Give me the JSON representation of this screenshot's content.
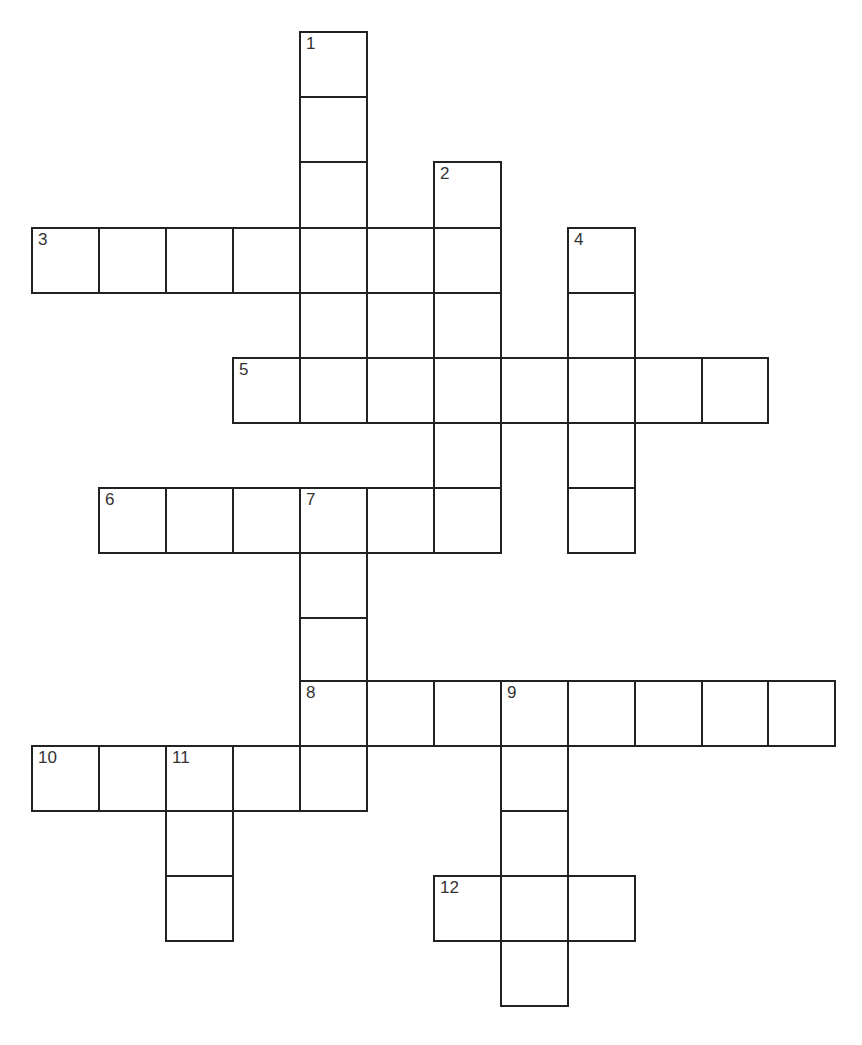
{
  "puzzle": {
    "type": "crossword",
    "line_color": "#222222",
    "number_color": "#333333",
    "background": "#ffffff",
    "col_x": [
      32,
      99,
      166,
      233,
      300,
      367,
      434,
      501,
      568,
      635,
      702,
      768,
      835
    ],
    "row_y": [
      32,
      97,
      162,
      228,
      293,
      358,
      423,
      488,
      553,
      618,
      681,
      746,
      811,
      876,
      941,
      1006
    ],
    "entries": [
      {
        "number": "1",
        "direction": "down",
        "row": 0,
        "col": 4,
        "length": 6
      },
      {
        "number": "2",
        "direction": "down",
        "row": 2,
        "col": 6,
        "length": 6
      },
      {
        "number": "3",
        "direction": "across",
        "row": 3,
        "col": 0,
        "length": 7
      },
      {
        "number": "4",
        "direction": "down",
        "row": 3,
        "col": 8,
        "length": 5
      },
      {
        "number": "5",
        "direction": "across",
        "row": 5,
        "col": 3,
        "length": 8
      },
      {
        "number": "6",
        "direction": "across",
        "row": 7,
        "col": 1,
        "length": 6
      },
      {
        "number": "7",
        "direction": "down",
        "row": 7,
        "col": 4,
        "length": 5
      },
      {
        "number": "8",
        "direction": "across",
        "row": 10,
        "col": 4,
        "length": 8
      },
      {
        "number": "9",
        "direction": "down",
        "row": 10,
        "col": 7,
        "length": 5
      },
      {
        "number": "10",
        "direction": "across",
        "row": 11,
        "col": 0,
        "length": 5
      },
      {
        "number": "11",
        "direction": "down",
        "row": 11,
        "col": 2,
        "length": 3
      },
      {
        "number": "12",
        "direction": "across",
        "row": 13,
        "col": 6,
        "length": 3
      }
    ],
    "extra_cells": [
      {
        "row": 4,
        "col": 5
      }
    ]
  }
}
